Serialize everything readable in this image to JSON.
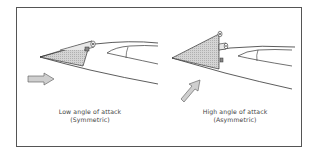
{
  "figure": {
    "panels": [
      {
        "id": "low",
        "caption_line1": "Low angle of attack",
        "caption_line2": "(Symmetric)",
        "flow_arrow_direction": "horizontal"
      },
      {
        "id": "high",
        "caption_line1": "High angle of attack",
        "caption_line2": "(Asymmetric)",
        "flow_arrow_direction": "diagonal-up"
      }
    ],
    "colors": {
      "stroke": "#333333",
      "fill_shaded": "#c8c8c8",
      "arrow_fill": "#cfcfcf",
      "frame": "#555555"
    }
  }
}
